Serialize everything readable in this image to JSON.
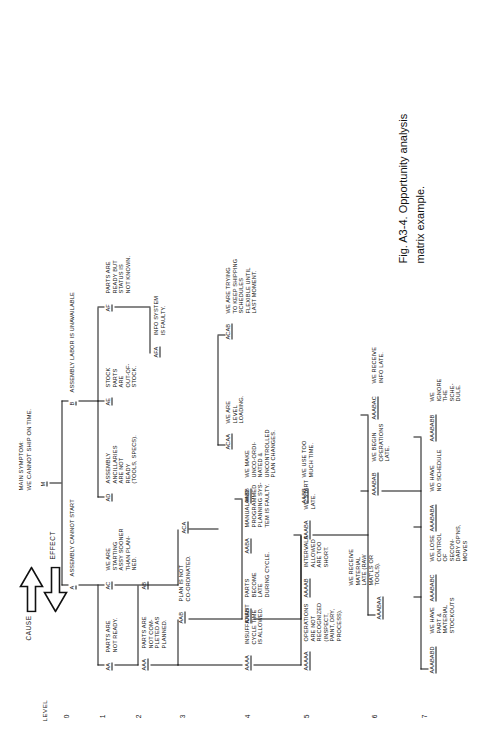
{
  "figure": {
    "caption_line1": "Fig. A3-4.  Opportunity analysis",
    "caption_line2": "matrix example."
  },
  "axis": {
    "level_label": "LEVEL",
    "levels": [
      "0",
      "1",
      "2",
      "3",
      "4",
      "5",
      "6",
      "7"
    ]
  },
  "direction": {
    "cause_label": "CAUSE",
    "effect_label": "EFFECT"
  },
  "header": {
    "main_symptom_title": "MAIN SYMPTOM:",
    "main_symptom_text": "WE CANNOT SHIP ON TIME.",
    "node_m": "M",
    "branch_a_code": "A",
    "branch_a_text": "ASSEMBLY CANNOT START",
    "branch_b_code": "B",
    "branch_b_text": "ASSEMBLY LABOR IS UNAVAILABLE"
  },
  "nodes": [
    {
      "code": "AA",
      "text": "PARTS ARE\nNOT READY."
    },
    {
      "code": "AB",
      "text": ""
    },
    {
      "code": "AC",
      "text": "WE ARE\nSTARTING\nASSY SOONER\nTHAN PLAN-\nNED."
    },
    {
      "code": "AD",
      "text": "ASSEMBLY\nANCILLARIES\nARE NOT\nREADY\n(TOOLS, SPECS)."
    },
    {
      "code": "AE",
      "text": "STOCK\nPARTS\nARE\nOUT-OF-\nSTOCK."
    },
    {
      "code": "AF",
      "text": "PARTS ARE\nREADY BUT\nSTATUS IS\nNOT KNOWN."
    },
    {
      "code": "AAA",
      "text": "PARTS ARE\nNOT COM-\nPLETED AS\nPLANNED."
    },
    {
      "code": "AAB",
      "text": "PLAN IS NOT\nCO-ORDINATED."
    },
    {
      "code": "ACA",
      "text": ""
    },
    {
      "code": "AFA",
      "text": "INFO SYSTEM\nIS FAULTY."
    },
    {
      "code": "AAAA",
      "text": "INSUFFICIENT\nCYCLE TIME\nIS ALLOWED."
    },
    {
      "code": "AAAB",
      "text": "PARTS\nBECOME\nLATE\nDURING CYCLE."
    },
    {
      "code": "AABA",
      "text": "MANUAL AND\nPROGRAMMED\nPLANNING SYS-\nTEM IS FAULTY."
    },
    {
      "code": "AABB",
      "text": "WE MAKE\nUNCO-ORDI-\nNATED &\nUNCONTROLLED\nPLAN CHANGES."
    },
    {
      "code": "ACAA",
      "text": "WE ARE\nLEVEL\nLOADING."
    },
    {
      "code": "ACAB",
      "text": "WE ARE TRYING\nTO KEEP SHIPPING\nSCHEDULES\nFLEXIBLE UNTIL\nLAST MOMENT."
    },
    {
      "code": "AAAAA",
      "text": "OPERATIONS\nARE NOT\nRECOGNIZED\n(INSPECT,\nPAINT, DRY,\nPROCESS)."
    },
    {
      "code": "AAAAB",
      "text": "INTERVALS\nALLOWED\nARE TOO\nSHORT."
    },
    {
      "code": "AAABA",
      "text": "WE START\nLATE."
    },
    {
      "code": "AABB",
      "text": "WE USE TOO\nMUCH TIME."
    },
    {
      "code": "AAABAA",
      "text": "WE RECEIVE\nMATERIAL\nLATE (RAW\nMAT'LS OR\nTOOLS)."
    },
    {
      "code": "AAABAB",
      "text": "WE BEGIN\nOPERATIONS\nLATE."
    },
    {
      "code": "AAABAC",
      "text": "WE RECEIVE\nINFO LATE."
    },
    {
      "code": "AAABABD",
      "text": "WE HAVE\nPART &\nMATERIAL\nSTOCKOUTS"
    },
    {
      "code": "AAABABC",
      "text": "WE LOSE\nCONTROL\nOF\nSECON-\nDARY OP'NS,\nMOVES"
    },
    {
      "code": "AAABABA",
      "text": "WE HAVE\nNO SCHEDULE"
    },
    {
      "code": "AAABABB",
      "text": "WE\nIGNORE\nTHE\nSCHE-\nDULE."
    }
  ]
}
